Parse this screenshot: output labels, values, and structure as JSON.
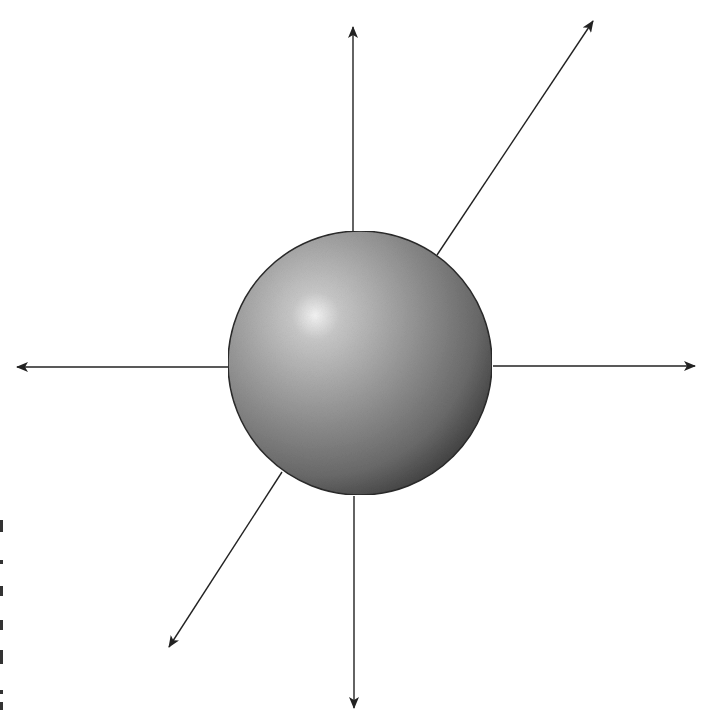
{
  "diagram": {
    "title": "",
    "colors": {
      "background": "#ffffff",
      "line": "#222222",
      "sphere_highlight": "#f4f4f4",
      "sphere_mid": "#9a9a9a",
      "sphere_shadow": "#3c3c3c",
      "sphere_outline": "#2a2a2a"
    },
    "sphere": {
      "cx": 360,
      "cy": 363,
      "r": 132,
      "highlight_x": 318,
      "highlight_y": 318
    },
    "arrows": [
      {
        "id": "up",
        "x1": 353,
        "y1": 231,
        "x2": 353,
        "y2": 27
      },
      {
        "id": "up-right",
        "x1": 437,
        "y1": 255,
        "x2": 593,
        "y2": 21
      },
      {
        "id": "left",
        "x1": 228,
        "y1": 367,
        "x2": 17,
        "y2": 367
      },
      {
        "id": "right",
        "x1": 493,
        "y1": 366,
        "x2": 695,
        "y2": 366
      },
      {
        "id": "down",
        "x1": 354,
        "y1": 496,
        "x2": 354,
        "y2": 708
      },
      {
        "id": "down-left",
        "x1": 282,
        "y1": 472,
        "x2": 169,
        "y2": 647
      }
    ]
  }
}
